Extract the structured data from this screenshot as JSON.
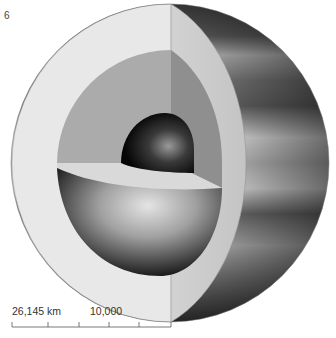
{
  "figure": {
    "number": "6",
    "layers": [
      "atmosphere",
      "crust-shell",
      "mantle",
      "lower-mantle-hemisphere",
      "core"
    ]
  },
  "scale_bar": {
    "total_label": "26,145 km",
    "tick_label": "10,000",
    "ticks": 6
  },
  "colors": {
    "background": "#ffffff",
    "shell": "#e6e6e6",
    "mantle": "#a8a8a8",
    "core": "#111111",
    "atmosphere_dark": "#4a4a4a",
    "atmosphere_light": "#b4b4b4"
  }
}
